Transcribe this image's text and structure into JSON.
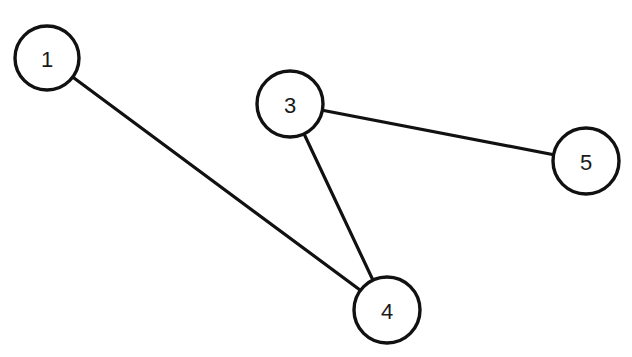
{
  "diagram": {
    "type": "undirected-graph",
    "colors": {
      "stroke": "#111111",
      "fill": "#ffffff",
      "text": "#1a1a1a"
    },
    "nodes": [
      {
        "id": "1",
        "label": "1",
        "x": 47,
        "y": 58,
        "r": 32
      },
      {
        "id": "3",
        "label": "3",
        "x": 290,
        "y": 104,
        "r": 33
      },
      {
        "id": "5",
        "label": "5",
        "x": 586,
        "y": 161,
        "r": 33
      },
      {
        "id": "4",
        "label": "4",
        "x": 387,
        "y": 310,
        "r": 33
      }
    ],
    "edges": [
      {
        "from": "1",
        "to": "4"
      },
      {
        "from": "3",
        "to": "4"
      },
      {
        "from": "3",
        "to": "5"
      }
    ]
  }
}
